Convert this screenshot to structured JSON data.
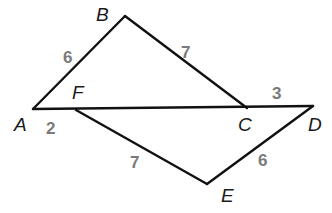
{
  "diagram": {
    "vertices": {
      "A": {
        "label": "A",
        "x": 33,
        "y": 109,
        "lx": 14,
        "ly": 131
      },
      "B": {
        "label": "B",
        "x": 125,
        "y": 16,
        "lx": 96,
        "ly": 21
      },
      "F": {
        "label": "F",
        "x": 76,
        "y": 110,
        "lx": 72,
        "ly": 99
      },
      "C": {
        "label": "C",
        "x": 247,
        "y": 108,
        "lx": 238,
        "ly": 131
      },
      "D": {
        "label": "D",
        "x": 313,
        "y": 106,
        "lx": 308,
        "ly": 131
      },
      "E": {
        "label": "E",
        "x": 207,
        "y": 184,
        "lx": 221,
        "ly": 202
      }
    },
    "edges": [
      {
        "from": "A",
        "to": "B",
        "length_label": "6",
        "lx": 63,
        "ly": 63
      },
      {
        "from": "B",
        "to": "C",
        "length_label": "7",
        "lx": 181,
        "ly": 58
      },
      {
        "from": "A",
        "to": "D",
        "length_label": "",
        "lx": 0,
        "ly": 0
      },
      {
        "from": "F",
        "to": "E",
        "length_label": "7",
        "lx": 130,
        "ly": 168
      },
      {
        "from": "E",
        "to": "D",
        "length_label": "6",
        "lx": 258,
        "ly": 166
      }
    ],
    "segment_labels": [
      {
        "segment": "AF",
        "value": "2",
        "x": 46,
        "y": 134
      },
      {
        "segment": "CD",
        "value": "3",
        "x": 272,
        "y": 99
      }
    ],
    "colors": {
      "line": "#111111",
      "vertex_label": "#1a1a1a",
      "measure_label": "#7a7a7a"
    }
  }
}
